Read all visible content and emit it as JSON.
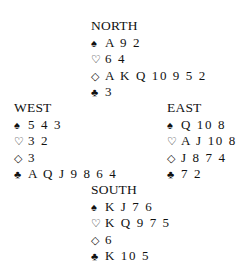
{
  "suits": {
    "spades": "♠",
    "hearts": "♡",
    "diamonds": "◇",
    "clubs": "♣"
  },
  "hands": {
    "north": {
      "label": "NORTH",
      "spades": "A 9 2",
      "hearts": "6 4",
      "diamonds": "A K Q 10 9 5 2",
      "clubs": "3"
    },
    "west": {
      "label": "WEST",
      "spades": "5 4 3",
      "hearts": "3 2",
      "diamonds": "3",
      "clubs": "A Q J 9 8 6 4"
    },
    "east": {
      "label": "EAST",
      "spades": "Q 10 8",
      "hearts": "A J 10 8",
      "diamonds": "J 8 7 4",
      "clubs": "7 2"
    },
    "south": {
      "label": "SOUTH",
      "spades": "K J 7 6",
      "hearts": "K Q 9 7 5",
      "diamonds": "6",
      "clubs": "K 10 5"
    }
  }
}
